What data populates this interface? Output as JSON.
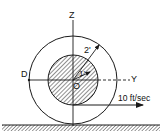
{
  "diagram": {
    "labels": {
      "z_axis": "Z",
      "y_axis": "Y",
      "point_d": "D",
      "origin": "O",
      "outer_radius": "2'",
      "inner_radius": "1'",
      "velocity": "10 ft/sec"
    },
    "colors": {
      "line": "#1a1a1a",
      "background": "#ffffff"
    }
  }
}
